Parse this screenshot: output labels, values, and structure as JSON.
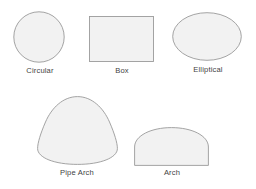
{
  "figure": {
    "background_color": "#ffffff",
    "shape_fill_color": "#f2f2f2",
    "shape_stroke_color": "#9a9a9a",
    "label_text_color": "#3f3f3f"
  },
  "shapes": [
    {
      "id": "circular",
      "label": "Circular",
      "geometry": "circle",
      "width_px": 52,
      "height_px": 52
    },
    {
      "id": "box",
      "label": "Box",
      "geometry": "rectangle",
      "width_px": 65,
      "height_px": 46
    },
    {
      "id": "elliptical",
      "label": "Elliptical",
      "geometry": "ellipse",
      "width_px": 70,
      "height_px": 49
    },
    {
      "id": "pipe-arch",
      "label": "Pipe Arch",
      "geometry": "rounded-triangle",
      "width_px": 81,
      "height_px": 69
    },
    {
      "id": "arch",
      "label": "Arch",
      "geometry": "semicircular-dome",
      "width_px": 75,
      "height_px": 39
    }
  ]
}
